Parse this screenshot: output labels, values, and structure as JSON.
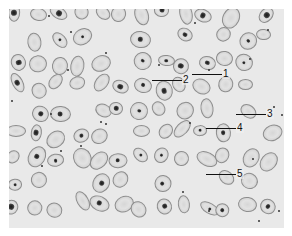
{
  "figure": {
    "background_color": "#e9e9e9",
    "labels": [
      {
        "id": "1",
        "text": "1",
        "line": {
          "x1": 192,
          "y1": 74,
          "x2": 222,
          "y2": 74
        },
        "text_pos": {
          "x": 222,
          "y": 69
        }
      },
      {
        "id": "2",
        "text": "2",
        "line": {
          "x1": 152,
          "y1": 80,
          "x2": 182,
          "y2": 80
        },
        "text_pos": {
          "x": 182,
          "y": 75
        }
      },
      {
        "id": "3",
        "text": "3",
        "line": {
          "x1": 236,
          "y1": 114,
          "x2": 266,
          "y2": 114
        },
        "text_pos": {
          "x": 266,
          "y": 109
        }
      },
      {
        "id": "4",
        "text": "4",
        "line": {
          "x1": 206,
          "y1": 128,
          "x2": 236,
          "y2": 128
        },
        "text_pos": {
          "x": 236,
          "y": 123
        }
      },
      {
        "id": "5",
        "text": "5",
        "line": {
          "x1": 206,
          "y1": 174,
          "x2": 236,
          "y2": 174
        },
        "text_pos": {
          "x": 236,
          "y": 169
        }
      }
    ]
  }
}
